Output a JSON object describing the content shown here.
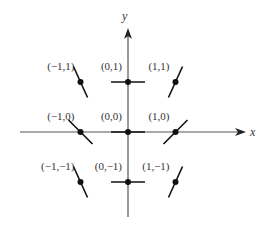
{
  "diagram": {
    "type": "slope-field",
    "axes": {
      "x_label": "x",
      "y_label": "y",
      "origin_px": [
        128,
        132
      ],
      "unit_px": [
        47.5,
        50
      ],
      "x_axis_px": [
        20,
        246
      ],
      "y_axis_px": [
        28,
        217
      ]
    },
    "points": [
      {
        "label": "(−1,1)",
        "x": -1,
        "y": 1,
        "slope": -2.2
      },
      {
        "label": "(0,1)",
        "x": 0,
        "y": 1,
        "slope": 0
      },
      {
        "label": "(1,1)",
        "x": 1,
        "y": 1,
        "slope": 2.2
      },
      {
        "label": "(−1,0)",
        "x": -1,
        "y": 0,
        "slope": -1
      },
      {
        "label": "(0,0)",
        "x": 0,
        "y": 0,
        "slope": 0
      },
      {
        "label": "(1,0)",
        "x": 1,
        "y": 0,
        "slope": 1
      },
      {
        "label": "(−1,−1)",
        "x": -1,
        "y": -1,
        "slope": -2.2
      },
      {
        "label": "(0,−1)",
        "x": 0,
        "y": -1,
        "slope": 0
      },
      {
        "label": "(1,−1)",
        "x": 1,
        "y": -1,
        "slope": 2.2
      }
    ],
    "colors": {
      "ink": "#111111",
      "axis": "#555555",
      "text": "#333333"
    }
  }
}
